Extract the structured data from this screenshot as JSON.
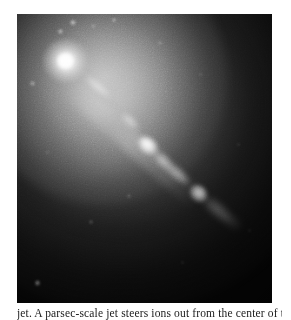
{
  "page": {
    "background_color": "#ffffff",
    "width": 291,
    "height": 319
  },
  "figure": {
    "name": "astronomical-image-m87-jet",
    "alt_description": "Greyscale astronomical image: bright elliptical galaxy core at upper left with a narrow relativistic jet of bright knots extending toward the lower right against a dark sky background",
    "frame": {
      "left": 17,
      "top": 14,
      "width": 255,
      "height": 289,
      "border_color": "#000000"
    },
    "color_mode": "greyscale",
    "background_color": "#070707",
    "highlight_color": "#ffffff"
  },
  "image_features": {
    "galaxy_core": {
      "label": "bright-galactic-nucleus",
      "position_pct": {
        "x": 19,
        "y": 15
      },
      "brightness": "saturated-white"
    },
    "halo": {
      "label": "diffuse-elliptical-halo",
      "center_pct": {
        "x": 17,
        "y": 12
      },
      "falloff": "radial-smooth"
    },
    "jet": {
      "label": "relativistic-jet",
      "direction": "upper-left-to-lower-right",
      "angle_degrees": 42,
      "knot_count": 8,
      "knots": [
        {
          "id": "A",
          "x_pct": 31,
          "y_pct": 25,
          "relative_brightness": 0.52
        },
        {
          "id": "B",
          "x_pct": 45,
          "y_pct": 37,
          "relative_brightness": 0.6
        },
        {
          "id": "C",
          "x_pct": 52,
          "y_pct": 45,
          "relative_brightness": 1.0
        },
        {
          "id": "D",
          "x_pct": 57,
          "y_pct": 51,
          "relative_brightness": 0.72
        },
        {
          "id": "E",
          "x_pct": 62,
          "y_pct": 56,
          "relative_brightness": 0.66
        },
        {
          "id": "F",
          "x_pct": 71,
          "y_pct": 62,
          "relative_brightness": 0.94
        },
        {
          "id": "G",
          "x_pct": 77,
          "y_pct": 68,
          "relative_brightness": 0.4
        },
        {
          "id": "H",
          "x_pct": 83,
          "y_pct": 72,
          "relative_brightness": 0.22
        }
      ]
    },
    "point_sources": [
      {
        "x_pct": 22,
        "y_pct": 3,
        "size": 2.4,
        "opacity": 0.7
      },
      {
        "x_pct": 38,
        "y_pct": 2,
        "size": 2.0,
        "opacity": 0.55
      },
      {
        "x_pct": 17,
        "y_pct": 6,
        "size": 2.2,
        "opacity": 0.6
      },
      {
        "x_pct": 30,
        "y_pct": 4,
        "size": 1.8,
        "opacity": 0.45
      },
      {
        "x_pct": 6,
        "y_pct": 24,
        "size": 2.2,
        "opacity": 0.48
      },
      {
        "x_pct": 56,
        "y_pct": 10,
        "size": 1.6,
        "opacity": 0.3
      },
      {
        "x_pct": 72,
        "y_pct": 21,
        "size": 1.6,
        "opacity": 0.26
      },
      {
        "x_pct": 44,
        "y_pct": 63,
        "size": 1.6,
        "opacity": 0.26
      },
      {
        "x_pct": 29,
        "y_pct": 72,
        "size": 1.8,
        "opacity": 0.3
      },
      {
        "x_pct": 8,
        "y_pct": 93,
        "size": 2.6,
        "opacity": 0.62
      },
      {
        "x_pct": 87,
        "y_pct": 45,
        "size": 1.4,
        "opacity": 0.22
      },
      {
        "x_pct": 65,
        "y_pct": 86,
        "size": 1.4,
        "opacity": 0.2
      },
      {
        "x_pct": 91,
        "y_pct": 75,
        "size": 1.4,
        "opacity": 0.18
      },
      {
        "x_pct": 12,
        "y_pct": 48,
        "size": 1.6,
        "opacity": 0.24
      }
    ]
  },
  "caption": {
    "text": "jet. A parsec-scale jet steers ions out from the center of the",
    "clipped": true
  }
}
